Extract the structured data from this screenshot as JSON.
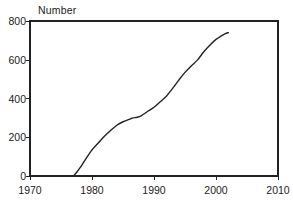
{
  "chart_data": {
    "type": "line",
    "title": "",
    "subtitle": "",
    "xlabel": "",
    "ylabel": "Number",
    "ylabel_position": "top-left",
    "xlim": [
      1970,
      2010
    ],
    "ylim": [
      0,
      800
    ],
    "xticks": [
      "1970",
      "1980",
      "1990",
      "2000",
      "2010"
    ],
    "xtick_values": [
      1970,
      1980,
      1990,
      2000,
      2010
    ],
    "yticks": [
      "0",
      "200",
      "400",
      "600",
      "800"
    ],
    "ytick_values": [
      0,
      200,
      400,
      600,
      800
    ],
    "grid": false,
    "legend": null,
    "legend_position": "none",
    "frame": "box",
    "line_color": "#222222",
    "line_width": 1.4,
    "annotations": [
      {
        "text": "Source: UNESCO",
        "x": 1999,
        "y": 95,
        "style": "italic",
        "align": "right"
      }
    ],
    "series": [
      {
        "name": "Number",
        "x": [
          1977,
          1977.6,
          1978.2,
          1979,
          1980,
          1981,
          1982,
          1983,
          1984,
          1985,
          1986,
          1986.6,
          1987.3,
          1988,
          1989,
          1990,
          1991,
          1992,
          1993,
          1994,
          1995,
          1996,
          1997,
          1998,
          1999,
          2000,
          2000.8,
          2001.5,
          2002
        ],
        "values": [
          0,
          22,
          48,
          88,
          135,
          170,
          205,
          235,
          262,
          280,
          292,
          300,
          303,
          312,
          334,
          355,
          383,
          412,
          452,
          495,
          535,
          568,
          598,
          640,
          675,
          705,
          722,
          735,
          740
        ]
      }
    ]
  },
  "axis_title": {
    "y": "Number"
  },
  "source": {
    "text": "Source: UNESCO"
  },
  "ticks": {
    "x": [
      {
        "label": "1970"
      },
      {
        "label": "1980"
      },
      {
        "label": "1990"
      },
      {
        "label": "2000"
      },
      {
        "label": "2010"
      }
    ],
    "y": [
      {
        "label": "800"
      },
      {
        "label": "600"
      },
      {
        "label": "400"
      },
      {
        "label": "200"
      },
      {
        "label": "0"
      }
    ]
  }
}
